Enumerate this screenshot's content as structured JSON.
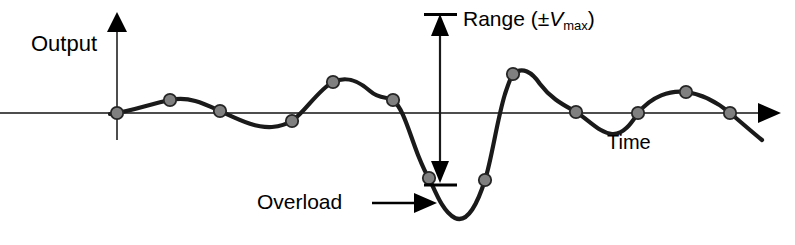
{
  "figure": {
    "labels": {
      "y_axis": "Output",
      "x_axis": "Time",
      "overload": "Overload",
      "range_prefix": "Range (±",
      "range_symbol": "V",
      "range_subscript": "max",
      "range_suffix": ")"
    },
    "colors": {
      "curve": "#1a1a1a",
      "axis": "#4d4d4d",
      "sample_dot_fill": "#808080",
      "sample_dot_stroke": "#262626",
      "background": "#ffffff",
      "text": "#000000"
    }
  },
  "chart_data": {
    "type": "line",
    "title": "",
    "xlabel": "Time",
    "ylabel": "Output",
    "grid": false,
    "legend": null,
    "axis_origin": [
      117,
      113
    ],
    "baseline_y": 113,
    "annotations": [
      {
        "name": "overload",
        "text": "Overload",
        "arrow_from": [
          375,
          203
        ],
        "arrow_to": [
          434,
          203
        ]
      },
      {
        "name": "range",
        "text": "Range (±Vmax)",
        "arrow_from": [
          440,
          16
        ],
        "arrow_to": [
          440,
          183
        ],
        "double_headed": true,
        "tick_top_y": 14,
        "tick_bottom_y": 184
      }
    ],
    "sample_points": [
      {
        "x": 117,
        "y": 113
      },
      {
        "x": 170,
        "y": 100
      },
      {
        "x": 220,
        "y": 111
      },
      {
        "x": 292,
        "y": 121
      },
      {
        "x": 333,
        "y": 82
      },
      {
        "x": 393,
        "y": 100
      },
      {
        "x": 429,
        "y": 178
      },
      {
        "x": 485,
        "y": 180
      },
      {
        "x": 513,
        "y": 74
      },
      {
        "x": 576,
        "y": 112
      },
      {
        "x": 638,
        "y": 113
      },
      {
        "x": 686,
        "y": 92
      },
      {
        "x": 730,
        "y": 113
      }
    ],
    "curve_path": "M 110,114 C 130,112 150,104 170,100 C 190,96 205,104 220,111 C 240,120 255,128 272,127 C 282,126 287,124 292,121 C 305,112 318,90 333,82 C 348,75 360,82 370,91 C 380,100 387,96 393,100 C 403,108 409,132 418,155 C 424,170 426,174 429,178 C 436,193 443,212 455,218 C 468,224 478,202 485,180 C 492,158 497,120 505,94 C 509,82 511,76 513,74 C 522,66 532,72 540,84 C 552,100 566,106 576,112 C 590,121 600,133 612,134 C 624,135 632,122 638,113 C 652,96 670,90 686,92 C 702,94 718,103 730,113 C 742,123 752,132 762,140"
  }
}
